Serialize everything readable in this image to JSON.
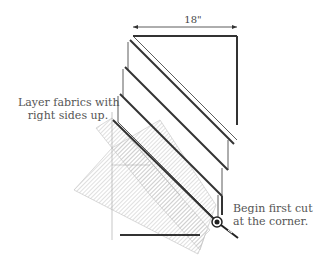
{
  "diagram": {
    "dimension_label": "18\"",
    "annotation_left": {
      "line1": "Layer fabrics with",
      "line2": "right sides up."
    },
    "annotation_right": {
      "line1": "Begin first cut",
      "line2": "at the corner."
    },
    "elements": [
      "stacked fabric layers",
      "quilting ruler",
      "rotary cutter"
    ],
    "colors": {
      "outline": "#333333",
      "ruler": "#bdbdbd",
      "text": "#555555"
    }
  }
}
